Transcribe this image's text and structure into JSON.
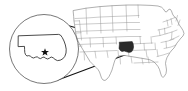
{
  "figure": {
    "type": "locator-map"
  },
  "map": {
    "name": "united-states-map",
    "region_label": "United States",
    "highlighted_state": "Oklahoma",
    "highlight_color": "#2b2b2b",
    "state_border_color": "#8c8c8c",
    "country_border_color": "#6e6e6e",
    "background_color": "#ffffff"
  },
  "inset": {
    "name": "magnifier-inset",
    "subject": "Oklahoma",
    "circle_color": "#555555",
    "outline_color": "#2b2b2b",
    "center_x": 44,
    "center_y": 49,
    "radius": 35
  },
  "capital": {
    "name": "Oklahoma City",
    "marker": "star",
    "marker_color": "#111111"
  },
  "leader_lines": {
    "name": "magnifier-leader-lines",
    "color": "#111111",
    "count": 2
  }
}
